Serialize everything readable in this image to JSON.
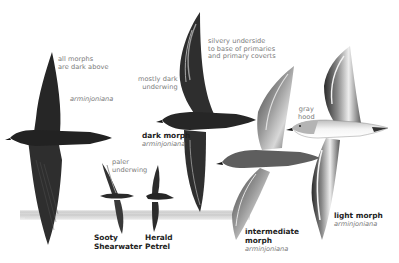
{
  "figure": {
    "colors": {
      "background": "#ffffff",
      "dark_bird": "#2b2b2b",
      "label_gray": "#7a7a7a",
      "name_dark": "#222222",
      "sea": "#cfcfcf"
    },
    "birds": [
      {
        "id": "upperside",
        "annotation": [
          "all morphs",
          "are dark above"
        ],
        "species_label": "arminjoniana"
      },
      {
        "id": "sooty-shearwater",
        "annotation": [
          "paler",
          "underwing"
        ],
        "name": [
          "Sooty",
          "Shearwater"
        ]
      },
      {
        "id": "herald-petrel",
        "name": [
          "Herald",
          "Petrel"
        ]
      },
      {
        "id": "dark-morph",
        "annotation": [
          "mostly dark",
          "underwing"
        ],
        "name": [
          "dark morph"
        ],
        "species_label": "arminjoniana"
      },
      {
        "id": "intermediate-morph",
        "annotation": [
          "silvery underside",
          "to base of primaries",
          "and primary coverts"
        ],
        "name": [
          "intermediate",
          "morph"
        ],
        "species_label": "arminjoniana"
      },
      {
        "id": "light-morph",
        "annotation": [
          "gray",
          "hood"
        ],
        "name": [
          "light morph"
        ],
        "species_label": "arminjoniana"
      }
    ]
  }
}
